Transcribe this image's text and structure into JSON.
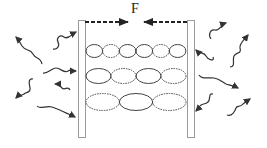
{
  "diagram": {
    "force_label": "F",
    "colors": {
      "plate_stroke": "#9a9a9a",
      "line": "#333333",
      "background": "#ffffff"
    },
    "plates": [
      {
        "name": "left-plate",
        "x": 78,
        "y": 20,
        "width": 7,
        "height": 118
      },
      {
        "name": "right-plate",
        "x": 187,
        "y": 20,
        "width": 7,
        "height": 118
      }
    ],
    "force_arrows": [
      {
        "name": "left-force-arrow",
        "from": [
          85,
          22
        ],
        "to": [
          128,
          22
        ]
      },
      {
        "name": "right-force-arrow",
        "from": [
          187,
          22
        ],
        "to": [
          144,
          22
        ]
      }
    ],
    "modes": [
      {
        "name": "mode-row-1",
        "y": 51,
        "lobes": 6,
        "ry": 7
      },
      {
        "name": "mode-row-2",
        "y": 76,
        "lobes": 4,
        "ry": 8
      },
      {
        "name": "mode-row-3",
        "y": 102,
        "lobes": 3,
        "ry": 9
      }
    ],
    "outside_fluctuations_count": 11
  }
}
